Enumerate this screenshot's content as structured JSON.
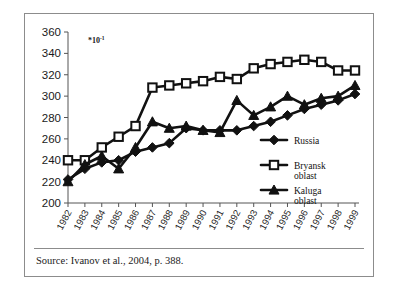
{
  "figure": {
    "exponent_prefix": "*10",
    "exponent_sup": "-1",
    "source_caption": "Source: Ivanov et al., 2004, p. 388."
  },
  "chart_data": {
    "type": "line",
    "title": "",
    "xlabel": "",
    "ylabel": "",
    "ylim": [
      200,
      360
    ],
    "yticks": [
      200,
      220,
      240,
      260,
      280,
      300,
      320,
      340,
      360
    ],
    "grid": false,
    "legend_position": "right-inside",
    "axis_note": "*10-1",
    "categories": [
      "1982",
      "1983",
      "1984",
      "1985",
      "1986",
      "1987",
      "1988",
      "1989",
      "1990",
      "1991",
      "1992",
      "1993",
      "1994",
      "1995",
      "1996",
      "1997",
      "1998",
      "1999"
    ],
    "series": [
      {
        "name": "Russia",
        "marker": "filled-diamond",
        "values": [
          222,
          232,
          238,
          240,
          248,
          252,
          256,
          270,
          268,
          268,
          268,
          272,
          276,
          282,
          288,
          292,
          296,
          302
        ]
      },
      {
        "name": "Bryansk oblast",
        "marker": "open-square",
        "values": [
          240,
          240,
          252,
          262,
          272,
          308,
          310,
          312,
          314,
          318,
          316,
          326,
          330,
          332,
          334,
          332,
          324,
          324
        ]
      },
      {
        "name": "Kaluga oblast",
        "marker": "filled-triangle",
        "values": [
          220,
          236,
          244,
          232,
          252,
          276,
          270,
          272,
          268,
          266,
          296,
          282,
          290,
          300,
          292,
          298,
          300,
          310
        ]
      }
    ],
    "legend_entries": [
      {
        "label": "Russia",
        "label_line2": "",
        "marker": "filled-diamond"
      },
      {
        "label": "Bryansk",
        "label_line2": "oblast",
        "marker": "open-square"
      },
      {
        "label": "Kaluga",
        "label_line2": "oblast",
        "marker": "filled-triangle"
      }
    ]
  }
}
